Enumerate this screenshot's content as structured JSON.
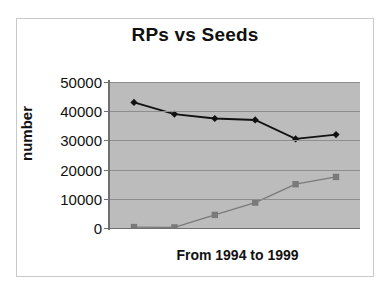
{
  "chart_data": {
    "type": "line",
    "title": "RPs vs Seeds",
    "xlabel": "From 1994 to 1999",
    "ylabel": "number",
    "categories": [
      "1994",
      "1995",
      "1996",
      "1997",
      "1998",
      "1999"
    ],
    "ylim": [
      0,
      50000
    ],
    "yticks": [
      50000,
      40000,
      30000,
      20000,
      10000,
      0
    ],
    "ytick_labels": [
      "50000",
      "40000",
      "30000",
      "20000",
      "10000",
      "0"
    ],
    "grid": true,
    "legend": "none",
    "series": [
      {
        "name": "RPs",
        "marker": "diamond",
        "color": "#111111",
        "values": [
          43000,
          39000,
          37500,
          37000,
          30500,
          32000
        ]
      },
      {
        "name": "Seeds",
        "marker": "square",
        "color": "#7a7a7a",
        "values": [
          300,
          200,
          4500,
          8700,
          15000,
          17500
        ]
      }
    ]
  },
  "colors": {
    "plot_background": "#bcbcbc",
    "gridline": "#8e8e8e",
    "axis": "#6f6f6f",
    "text": "#111111",
    "frame": "#c9c9c9",
    "page_background": "#ffffff"
  }
}
